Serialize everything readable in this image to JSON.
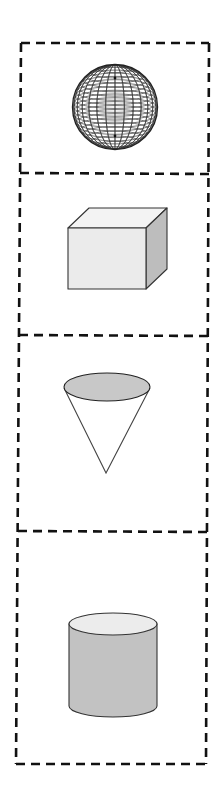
{
  "figure": {
    "panels": [
      {
        "id": "sphere",
        "shape": "sphere"
      },
      {
        "id": "cube",
        "shape": "cube"
      },
      {
        "id": "cone",
        "shape": "cone"
      },
      {
        "id": "cylinder",
        "shape": "cylinder"
      }
    ]
  },
  "colors": {
    "border": "#111111",
    "stroke": "#333333",
    "cube_front": "#ebebeb",
    "cube_top": "#f3f3f3",
    "cube_side": "#bdbdbd",
    "cone_top": "#c8c8c8",
    "cone_body": "#ffffff",
    "cylinder_body": "#c2c2c2",
    "cylinder_top": "#ececec",
    "sphere_line": "#3a3a3a"
  }
}
